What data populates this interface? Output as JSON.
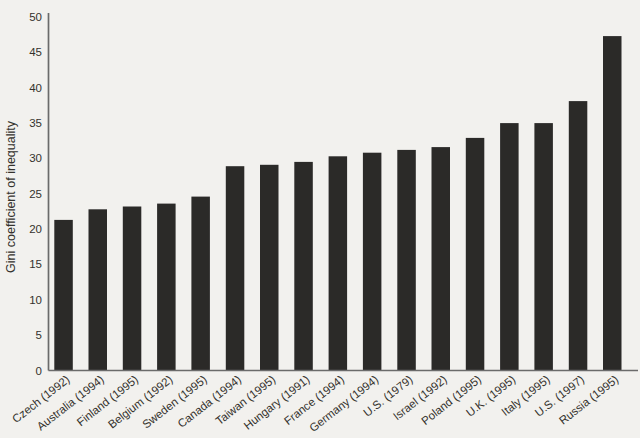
{
  "figure": {
    "background_color": "#f2f1ee",
    "bar_color": "#2b2a28",
    "axis_color": "#6b6b6b",
    "text_color": "#34322d"
  },
  "chart_data": {
    "type": "bar",
    "title": "",
    "xlabel": "",
    "ylabel": "Gini coefficient of inequality",
    "ylim": [
      0,
      50
    ],
    "yticks": [
      0,
      5,
      10,
      15,
      20,
      25,
      30,
      35,
      40,
      45,
      50
    ],
    "grid": false,
    "legend": null,
    "categories": [
      "Czech (1992)",
      "Australia (1994)",
      "Finland (1995)",
      "Belgium (1992)",
      "Sweden (1995)",
      "Canada (1994)",
      "Taiwan (1995)",
      "Hungary (1991)",
      "France (1994)",
      "Germany (1994)",
      "U.S. (1979)",
      "Israel (1992)",
      "Poland (1995)",
      "U.K. (1995)",
      "Italy (1995)",
      "U.S. (1997)",
      "Russia (1995)"
    ],
    "values": [
      21.3,
      22.8,
      23.2,
      23.6,
      24.6,
      28.9,
      29.1,
      29.5,
      30.3,
      30.8,
      31.2,
      31.6,
      32.9,
      35.0,
      35.0,
      38.1,
      47.3
    ]
  }
}
